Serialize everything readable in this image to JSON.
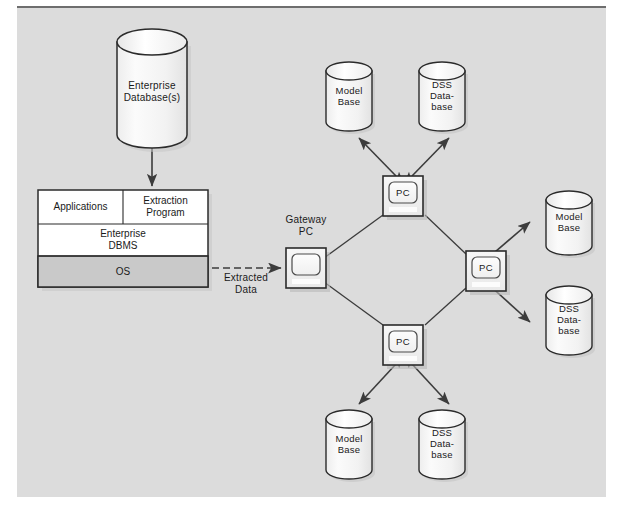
{
  "figure": {
    "background_color": "#dcdcdc",
    "panel_border_color": "#6e6e6e",
    "line_color": "#3c3c3c",
    "shape_fill": "#f5f5f5",
    "os_row_fill": "#c9c9c9"
  },
  "enterprise_database": {
    "label": "Enterprise\nDatabase(s)",
    "shape": "cylinder-icon"
  },
  "host_stack": {
    "applications": "Applications",
    "extraction_program": "Extraction\nProgram",
    "enterprise_dbms": "Enterprise\nDBMS",
    "os": "OS"
  },
  "extracted_data": {
    "label": "Extracted\nData",
    "arrow": "dashed-arrow-icon"
  },
  "gateway_pc": {
    "label": "Gateway\nPC",
    "screen_text": "",
    "icon": "pc-icon"
  },
  "network_pcs": [
    {
      "id": "top",
      "label": "PC",
      "icon": "pc-icon"
    },
    {
      "id": "right",
      "label": "PC",
      "icon": "pc-icon"
    },
    {
      "id": "bottom",
      "label": "PC",
      "icon": "pc-icon"
    }
  ],
  "databases": [
    {
      "id": "top-model",
      "label": "Model\nBase",
      "icon": "cylinder-icon"
    },
    {
      "id": "top-dss",
      "label": "DSS\nData-\nbase",
      "icon": "cylinder-icon"
    },
    {
      "id": "right-model",
      "label": "Model\nBase",
      "icon": "cylinder-icon"
    },
    {
      "id": "right-dss",
      "label": "DSS\nData-\nbase",
      "icon": "cylinder-icon"
    },
    {
      "id": "bottom-model",
      "label": "Model\nBase",
      "icon": "cylinder-icon"
    },
    {
      "id": "bottom-dss",
      "label": "DSS\nData-\nbase",
      "icon": "cylinder-icon"
    }
  ]
}
